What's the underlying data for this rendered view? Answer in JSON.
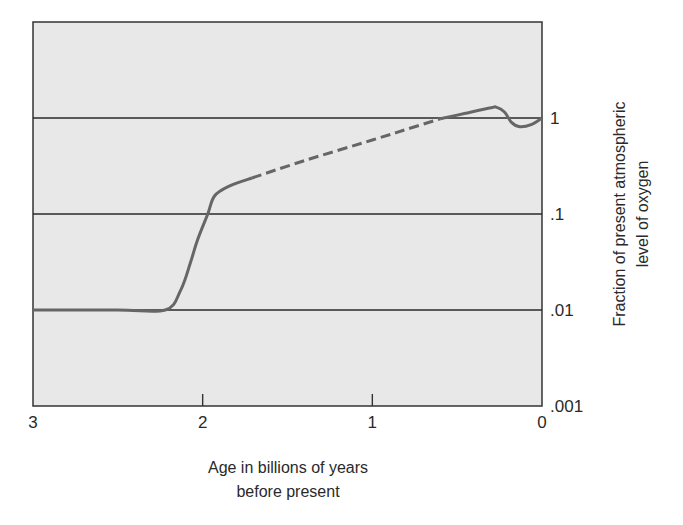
{
  "chart_data": {
    "type": "line",
    "title": "",
    "xlabel": "Age in billions of years before present",
    "xlabel_lines": [
      "Age in billions of years",
      "before present"
    ],
    "ylabel": "Fraction of present atmospheric level of oxygen",
    "ylabel_lines": [
      "Fraction of present atmospheric",
      "level of oxygen"
    ],
    "xlim": [
      3,
      0
    ],
    "x_reversed": true,
    "ylim": [
      0.001,
      10
    ],
    "y_scale": "log",
    "y_axis_position": "right",
    "grid": true,
    "x_ticks": [
      {
        "value": 3,
        "label": "3"
      },
      {
        "value": 2,
        "label": "2"
      },
      {
        "value": 1,
        "label": "1"
      },
      {
        "value": 0,
        "label": "0"
      }
    ],
    "y_ticks": [
      {
        "value": 1,
        "label": "1"
      },
      {
        "value": 0.1,
        "label": ".1"
      },
      {
        "value": 0.01,
        "label": ".01"
      },
      {
        "value": 0.001,
        "label": ".001"
      }
    ],
    "series": [
      {
        "name": "Atmospheric oxygen (solid, early)",
        "style": "solid",
        "x": [
          3.0,
          2.5,
          2.22,
          2.13,
          2.07,
          2.03,
          1.97,
          1.93,
          1.84,
          1.71
        ],
        "values": [
          0.01,
          0.01,
          0.01,
          0.016,
          0.032,
          0.054,
          0.1,
          0.154,
          0.196,
          0.237
        ]
      },
      {
        "name": "Atmospheric oxygen (dashed, uncertain)",
        "style": "dashed",
        "x": [
          1.71,
          1.4,
          1.0,
          0.8,
          0.6
        ],
        "values": [
          0.237,
          0.36,
          0.59,
          0.76,
          0.98
        ]
      },
      {
        "name": "Atmospheric oxygen (solid, recent)",
        "style": "solid",
        "x": [
          0.6,
          0.45,
          0.3,
          0.27,
          0.22,
          0.18,
          0.13,
          0.06,
          0.0
        ],
        "values": [
          0.98,
          1.12,
          1.28,
          1.3,
          1.15,
          0.9,
          0.81,
          0.86,
          1.0
        ]
      }
    ],
    "colors": {
      "plot_background": "#e8e8e8",
      "frame": "#333333",
      "gridline": "#2a2a2a",
      "curve": "#666666"
    }
  }
}
